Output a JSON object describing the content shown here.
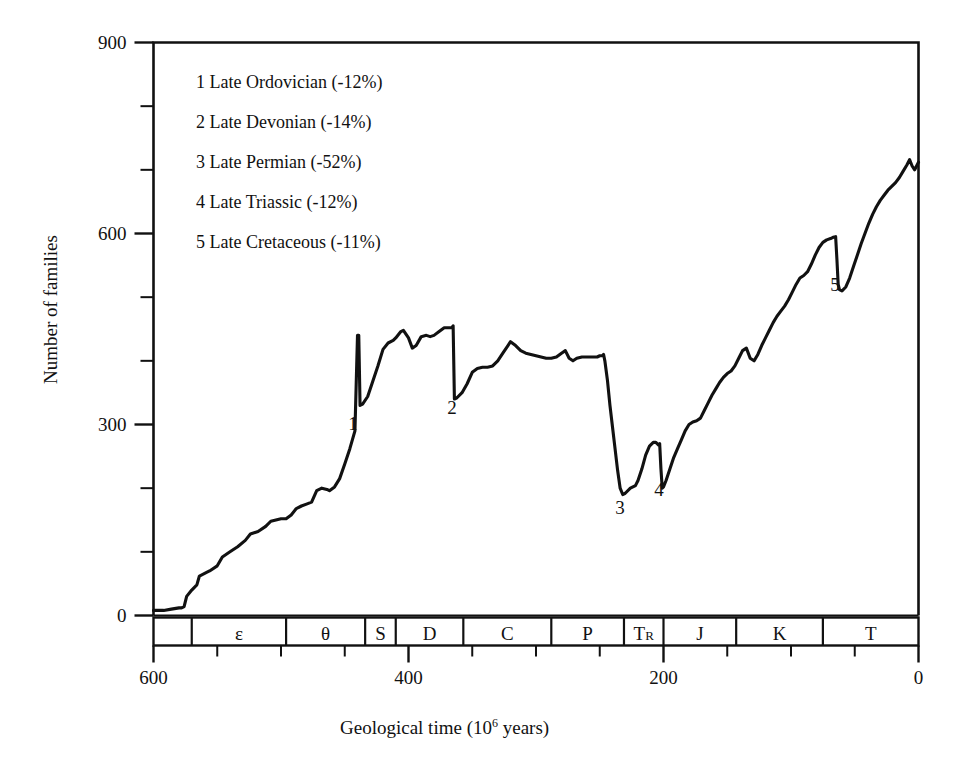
{
  "figure": {
    "background_color": "#ffffff",
    "line_color": "#111111",
    "axis_color": "#111111"
  },
  "axes": {
    "y_title": "Number of families",
    "x_title_prefix": "Geological time (10",
    "x_title_sup": "6",
    "x_title_suffix": " years)",
    "y_ticks": [
      {
        "value": 900,
        "label": "900"
      },
      {
        "value": 800,
        "label": ""
      },
      {
        "value": 700,
        "label": ""
      },
      {
        "value": 600,
        "label": "600"
      },
      {
        "value": 500,
        "label": ""
      },
      {
        "value": 400,
        "label": ""
      },
      {
        "value": 300,
        "label": "300"
      },
      {
        "value": 200,
        "label": ""
      },
      {
        "value": 100,
        "label": ""
      },
      {
        "value": 0,
        "label": "0"
      }
    ],
    "x_ticks": [
      {
        "value": 600,
        "label": "600"
      },
      {
        "value": 550,
        "label": ""
      },
      {
        "value": 500,
        "label": ""
      },
      {
        "value": 450,
        "label": ""
      },
      {
        "value": 400,
        "label": "400"
      },
      {
        "value": 350,
        "label": ""
      },
      {
        "value": 300,
        "label": ""
      },
      {
        "value": 250,
        "label": ""
      },
      {
        "value": 200,
        "label": "200"
      },
      {
        "value": 150,
        "label": ""
      },
      {
        "value": 100,
        "label": ""
      },
      {
        "value": 50,
        "label": ""
      },
      {
        "value": 0,
        "label": "0"
      }
    ]
  },
  "legend": {
    "entries": [
      "1 Late Ordovician (-12%)",
      "2 Late Devonian (-14%)",
      "3 Late Permian (-52%)",
      "4 Late Triassic (-12%)",
      "5 Late Cretaceous (-11%)"
    ]
  },
  "event_labels": [
    {
      "id": "1",
      "text": "1",
      "x": 353,
      "y": 414
    },
    {
      "id": "2",
      "text": "2",
      "x": 452,
      "y": 398
    },
    {
      "id": "3",
      "text": "3",
      "x": 620,
      "y": 498
    },
    {
      "id": "4",
      "text": "4",
      "x": 659,
      "y": 480
    },
    {
      "id": "5",
      "text": "5",
      "x": 835,
      "y": 275
    }
  ],
  "period_bar": {
    "boxes": [
      {
        "label": "",
        "start": 600,
        "end": 570
      },
      {
        "label": "ε",
        "start": 570,
        "end": 496
      },
      {
        "label": "θ",
        "start": 496,
        "end": 434
      },
      {
        "label": "S",
        "start": 434,
        "end": 410
      },
      {
        "label": "D",
        "start": 410,
        "end": 357
      },
      {
        "label": "C",
        "start": 357,
        "end": 288
      },
      {
        "label": "P",
        "start": 288,
        "end": 231
      },
      {
        "label": "T",
        "sub": "R",
        "start": 231,
        "end": 200
      },
      {
        "label": "J",
        "start": 200,
        "end": 143
      },
      {
        "label": "K",
        "start": 143,
        "end": 75
      },
      {
        "label": "T",
        "start": 75,
        "end": 0
      }
    ]
  },
  "chart_data": {
    "type": "line",
    "title": "",
    "xlabel": "Geological time (10^6 years)",
    "ylabel": "Number of families",
    "xlim": [
      600,
      0
    ],
    "ylim": [
      0,
      900
    ],
    "grid": false,
    "legend_position": "upper-left-inside",
    "x_axis_reversed": true,
    "annotations": [
      {
        "marker": "1",
        "event": "Late Ordovician",
        "loss_percent": -12,
        "x": 440,
        "y_before": 440,
        "y_after": 330
      },
      {
        "marker": "2",
        "event": "Late Devonian",
        "loss_percent": -14,
        "x": 365,
        "y_before": 455,
        "y_after": 340
      },
      {
        "marker": "3",
        "event": "Late Permian",
        "loss_percent": -52,
        "x": 247,
        "y_before": 410,
        "y_after": 190
      },
      {
        "marker": "4",
        "event": "Late Triassic",
        "loss_percent": -12,
        "x": 203,
        "y_before": 270,
        "y_after": 200
      },
      {
        "marker": "5",
        "event": "Late Cretaceous",
        "loss_percent": -11,
        "x": 65,
        "y_before": 595,
        "y_after": 510
      }
    ],
    "series": [
      {
        "name": "Number of marine families",
        "points": [
          [
            600,
            8
          ],
          [
            592,
            8
          ],
          [
            586,
            10
          ],
          [
            580,
            12
          ],
          [
            578,
            12
          ],
          [
            576,
            14
          ],
          [
            574,
            30
          ],
          [
            570,
            40
          ],
          [
            566,
            48
          ],
          [
            564,
            62
          ],
          [
            558,
            68
          ],
          [
            556,
            70
          ],
          [
            550,
            78
          ],
          [
            546,
            92
          ],
          [
            540,
            100
          ],
          [
            534,
            108
          ],
          [
            528,
            118
          ],
          [
            524,
            128
          ],
          [
            518,
            132
          ],
          [
            512,
            140
          ],
          [
            508,
            148
          ],
          [
            504,
            150
          ],
          [
            500,
            152
          ],
          [
            496,
            152
          ],
          [
            492,
            158
          ],
          [
            488,
            168
          ],
          [
            484,
            172
          ],
          [
            480,
            175
          ],
          [
            476,
            178
          ],
          [
            472,
            196
          ],
          [
            468,
            200
          ],
          [
            464,
            198
          ],
          [
            462,
            196
          ],
          [
            458,
            202
          ],
          [
            454,
            215
          ],
          [
            450,
            238
          ],
          [
            446,
            262
          ],
          [
            442,
            290
          ],
          [
            440,
            440
          ],
          [
            439,
            440
          ],
          [
            438,
            330
          ],
          [
            436,
            332
          ],
          [
            432,
            344
          ],
          [
            428,
            368
          ],
          [
            424,
            392
          ],
          [
            420,
            418
          ],
          [
            416,
            428
          ],
          [
            412,
            432
          ],
          [
            410,
            436
          ],
          [
            406,
            446
          ],
          [
            404,
            448
          ],
          [
            400,
            436
          ],
          [
            397,
            420
          ],
          [
            394,
            424
          ],
          [
            390,
            438
          ],
          [
            386,
            440
          ],
          [
            383,
            438
          ],
          [
            380,
            440
          ],
          [
            376,
            446
          ],
          [
            372,
            452
          ],
          [
            368,
            452
          ],
          [
            366,
            452
          ],
          [
            365,
            455
          ],
          [
            364,
            340
          ],
          [
            362,
            342
          ],
          [
            358,
            350
          ],
          [
            354,
            364
          ],
          [
            350,
            382
          ],
          [
            346,
            388
          ],
          [
            342,
            390
          ],
          [
            338,
            390
          ],
          [
            334,
            392
          ],
          [
            330,
            400
          ],
          [
            326,
            412
          ],
          [
            322,
            424
          ],
          [
            320,
            430
          ],
          [
            316,
            424
          ],
          [
            312,
            416
          ],
          [
            308,
            412
          ],
          [
            304,
            410
          ],
          [
            300,
            408
          ],
          [
            296,
            406
          ],
          [
            292,
            404
          ],
          [
            288,
            404
          ],
          [
            284,
            406
          ],
          [
            280,
            412
          ],
          [
            277,
            416
          ],
          [
            274,
            404
          ],
          [
            271,
            400
          ],
          [
            268,
            404
          ],
          [
            264,
            406
          ],
          [
            260,
            406
          ],
          [
            256,
            406
          ],
          [
            252,
            406
          ],
          [
            250,
            408
          ],
          [
            248,
            408
          ],
          [
            247,
            410
          ],
          [
            246,
            400
          ],
          [
            244,
            370
          ],
          [
            242,
            330
          ],
          [
            240,
            296
          ],
          [
            238,
            262
          ],
          [
            236,
            228
          ],
          [
            234,
            200
          ],
          [
            232,
            190
          ],
          [
            230,
            192
          ],
          [
            226,
            200
          ],
          [
            222,
            204
          ],
          [
            220,
            212
          ],
          [
            217,
            230
          ],
          [
            214,
            252
          ],
          [
            211,
            266
          ],
          [
            208,
            272
          ],
          [
            206,
            272
          ],
          [
            204,
            268
          ],
          [
            203,
            270
          ],
          [
            202,
            230
          ],
          [
            201,
            200
          ],
          [
            200,
            202
          ],
          [
            198,
            212
          ],
          [
            195,
            230
          ],
          [
            192,
            248
          ],
          [
            189,
            262
          ],
          [
            186,
            276
          ],
          [
            183,
            290
          ],
          [
            180,
            300
          ],
          [
            177,
            304
          ],
          [
            174,
            306
          ],
          [
            171,
            310
          ],
          [
            168,
            322
          ],
          [
            165,
            334
          ],
          [
            162,
            346
          ],
          [
            159,
            356
          ],
          [
            156,
            366
          ],
          [
            153,
            374
          ],
          [
            150,
            380
          ],
          [
            147,
            384
          ],
          [
            144,
            392
          ],
          [
            141,
            404
          ],
          [
            138,
            416
          ],
          [
            135,
            420
          ],
          [
            132,
            404
          ],
          [
            129,
            400
          ],
          [
            126,
            410
          ],
          [
            123,
            424
          ],
          [
            120,
            436
          ],
          [
            117,
            448
          ],
          [
            114,
            460
          ],
          [
            111,
            470
          ],
          [
            108,
            478
          ],
          [
            105,
            486
          ],
          [
            102,
            496
          ],
          [
            99,
            508
          ],
          [
            96,
            520
          ],
          [
            93,
            530
          ],
          [
            90,
            534
          ],
          [
            87,
            540
          ],
          [
            84,
            552
          ],
          [
            81,
            566
          ],
          [
            78,
            578
          ],
          [
            75,
            586
          ],
          [
            72,
            590
          ],
          [
            69,
            592
          ],
          [
            67,
            594
          ],
          [
            65,
            595
          ],
          [
            64,
            560
          ],
          [
            63,
            520
          ],
          [
            62,
            512
          ],
          [
            60,
            510
          ],
          [
            57,
            516
          ],
          [
            54,
            530
          ],
          [
            51,
            548
          ],
          [
            48,
            566
          ],
          [
            45,
            584
          ],
          [
            42,
            600
          ],
          [
            39,
            616
          ],
          [
            36,
            630
          ],
          [
            33,
            642
          ],
          [
            30,
            652
          ],
          [
            27,
            660
          ],
          [
            24,
            668
          ],
          [
            21,
            674
          ],
          [
            18,
            680
          ],
          [
            15,
            688
          ],
          [
            12,
            698
          ],
          [
            9,
            708
          ],
          [
            7,
            716
          ],
          [
            5,
            706
          ],
          [
            3,
            700
          ],
          [
            2,
            704
          ],
          [
            0,
            712
          ]
        ]
      }
    ]
  }
}
